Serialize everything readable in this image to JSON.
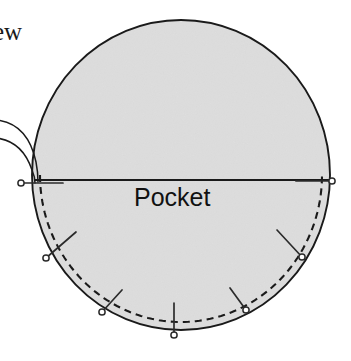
{
  "figure": {
    "type": "sewing-pattern-diagram",
    "title_partial": "ew",
    "pocket_label": "Pocket",
    "background_color": "#ffffff",
    "fabric_fill_color": "#e3e3e3",
    "outline_color": "#1a1a1a",
    "stitch_line_color": "#1a1a1a",
    "pin_color": "#2b2b2b"
  },
  "circle": {
    "center_x": 181,
    "center_y": 175,
    "radius_x": 149,
    "radius_y": 155,
    "left": 32,
    "right": 330,
    "top": 20,
    "bottom": 330
  },
  "fold_line": {
    "label": "fold-line",
    "y": 180,
    "x_start": 34,
    "x_end": 329
  },
  "stitch_line": {
    "label": "basting-stitch-line",
    "style": "dashed",
    "dash_pattern": "7 5",
    "inset": 8
  },
  "pins": [
    {
      "name": "pin-left-edge",
      "head_x": 21,
      "head_y": 183,
      "tip_x": 63,
      "tip_y": 183
    },
    {
      "name": "pin-right-edge",
      "head_x": 332,
      "head_y": 181,
      "tip_x": 296,
      "tip_y": 181
    },
    {
      "name": "pin-lower-left",
      "head_x": 46,
      "head_y": 258,
      "tip_x": 76,
      "tip_y": 232
    },
    {
      "name": "pin-bottom-left",
      "head_x": 102,
      "head_y": 312,
      "tip_x": 122,
      "tip_y": 290
    },
    {
      "name": "pin-bottom-center",
      "head_x": 174,
      "head_y": 335,
      "tip_x": 174,
      "tip_y": 303
    },
    {
      "name": "pin-bottom-right",
      "head_x": 246,
      "head_y": 310,
      "tip_x": 230,
      "tip_y": 288
    },
    {
      "name": "pin-lower-right",
      "head_x": 302,
      "head_y": 257,
      "tip_x": 277,
      "tip_y": 230
    }
  ],
  "leader_lines": [
    {
      "name": "leader-line-upper",
      "path": "M -4 120 C 16 122, 30 134, 36 162 C 38 172, 38 177, 38 182"
    },
    {
      "name": "leader-line-lower",
      "path": "M -4 138 C 14 140, 26 152, 32 170 C 35 177, 35 180, 35 183"
    }
  ]
}
